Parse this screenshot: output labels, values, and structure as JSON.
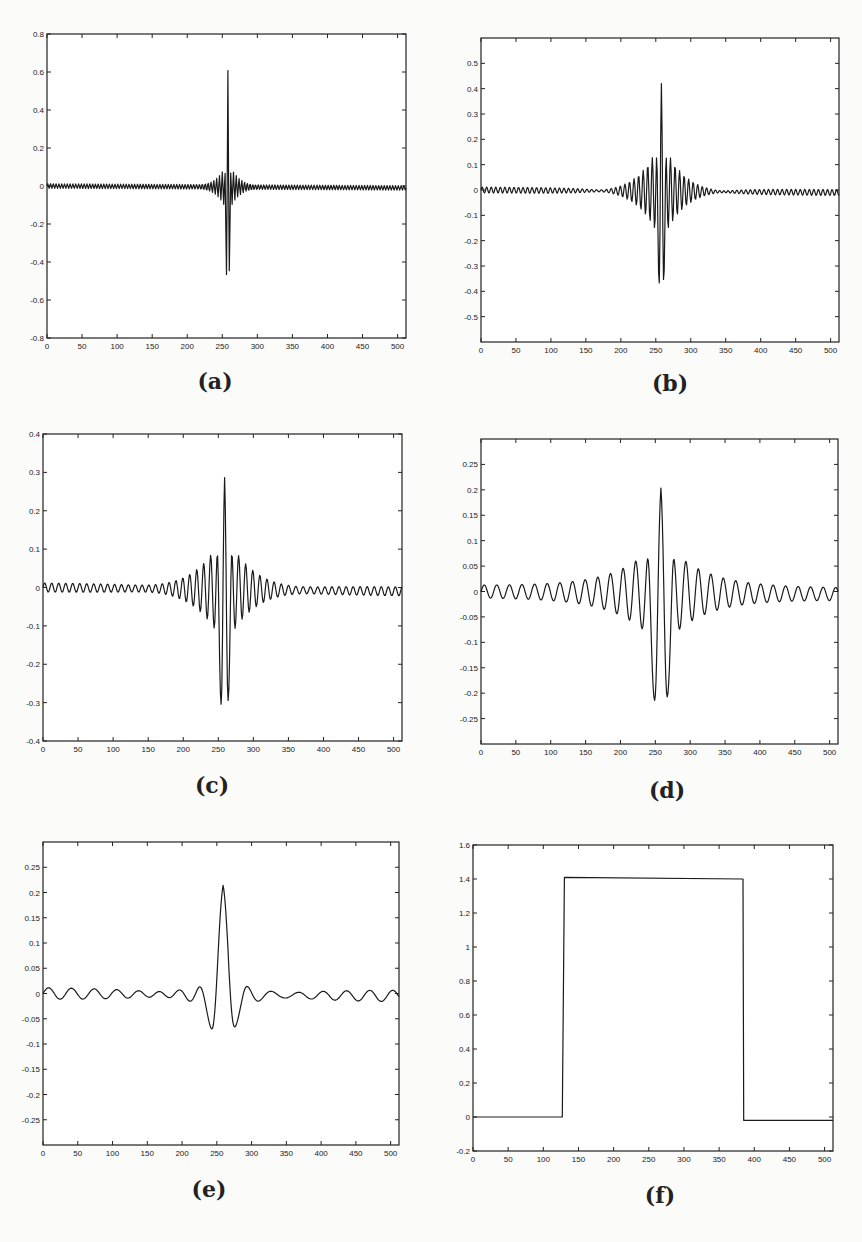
{
  "figure": {
    "panels": [
      {
        "id": "a",
        "caption": "(a)"
      },
      {
        "id": "b",
        "caption": "(b)"
      },
      {
        "id": "c",
        "caption": "(c)"
      },
      {
        "id": "d",
        "caption": "(d)"
      },
      {
        "id": "e",
        "caption": "(e)"
      },
      {
        "id": "f",
        "caption": "(f)"
      }
    ]
  },
  "chart_data": [
    {
      "panel": "(a)",
      "type": "line",
      "title": "",
      "xlabel": "",
      "ylabel": "",
      "xlim": [
        0,
        512
      ],
      "ylim": [
        -0.8,
        0.8
      ],
      "xticks": [
        0,
        50,
        100,
        150,
        200,
        250,
        300,
        350,
        400,
        450,
        500
      ],
      "yticks": [
        -0.8,
        -0.6,
        -0.4,
        -0.2,
        0,
        0.2,
        0.4,
        0.6,
        0.8
      ],
      "ytick_labels": [
        "-0.8",
        "-0.6",
        "-0.4",
        "-0.2",
        "0",
        "0.2",
        "0.4",
        "0.6",
        "0.8"
      ],
      "grid": false,
      "description": "Highly localized oscillating wavelet centered near x=258; main peak ~0.70, main trough ~-0.46, envelope decaying rapidly; nearly flat elsewhere with slight negative drift to ~-0.01 at x=512",
      "signal": {
        "center": 258,
        "peak": 0.7,
        "trough": -0.46,
        "period": 4,
        "decay": 14,
        "envelope_amp": 0.14,
        "drift_end": -0.01
      },
      "key_points": [
        {
          "x": 258,
          "y": 0.7
        },
        {
          "x": 257,
          "y": -0.46
        },
        {
          "x": 258,
          "y": 0.14
        },
        {
          "x": 0,
          "y": 0
        },
        {
          "x": 512,
          "y": -0.01
        }
      ]
    },
    {
      "panel": "(b)",
      "type": "line",
      "title": "",
      "xlabel": "",
      "ylabel": "",
      "xlim": [
        0,
        512
      ],
      "ylim": [
        -0.6,
        0.6
      ],
      "xticks": [
        0,
        50,
        100,
        150,
        200,
        250,
        300,
        350,
        400,
        450,
        500
      ],
      "yticks": [
        -0.5,
        -0.4,
        -0.3,
        -0.2,
        -0.1,
        0,
        0.1,
        0.2,
        0.3,
        0.4,
        0.5
      ],
      "ytick_labels": [
        "-0.5",
        "-0.4",
        "-0.3",
        "-0.2",
        "-0.1",
        "0",
        "0.1",
        "0.2",
        "0.3",
        "0.4",
        "0.5"
      ],
      "grid": false,
      "description": "Oscillating wavelet centered at x~258; peak ~0.49, side peaks ~0.21, troughs ~-0.37; oscillation period ~6 samples with slow decay",
      "signal": {
        "center": 258,
        "peak": 0.49,
        "trough": -0.37,
        "period": 6.5,
        "decay": 30,
        "envelope_amp": 0.21,
        "drift_end": -0.01
      },
      "key_points": [
        {
          "x": 258,
          "y": 0.49
        },
        {
          "x": 252,
          "y": 0.21
        },
        {
          "x": 264,
          "y": 0.2
        },
        {
          "x": 254,
          "y": -0.37
        },
        {
          "x": 262,
          "y": -0.36
        }
      ]
    },
    {
      "panel": "(c)",
      "type": "line",
      "title": "",
      "xlabel": "",
      "ylabel": "",
      "xlim": [
        0,
        512
      ],
      "ylim": [
        -0.4,
        0.4
      ],
      "xticks": [
        0,
        50,
        100,
        150,
        200,
        250,
        300,
        350,
        400,
        450,
        500
      ],
      "yticks": [
        -0.4,
        -0.3,
        -0.2,
        -0.1,
        0,
        0.1,
        0.2,
        0.3,
        0.4
      ],
      "ytick_labels": [
        "-0.4",
        "-0.3",
        "-0.2",
        "-0.1",
        "0",
        "0.1",
        "0.2",
        "0.3",
        "0.4"
      ],
      "grid": false,
      "description": "Wavelet centered at x~259; peak ~0.34, side peaks ~0.15/0.14, troughs ~-0.30/-0.29; small ripple ~±0.01 elsewhere",
      "signal": {
        "center": 259,
        "peak": 0.34,
        "trough": -0.3,
        "period": 10,
        "decay": 40,
        "envelope_amp": 0.15,
        "drift_end": -0.01
      },
      "key_points": [
        {
          "x": 259,
          "y": 0.34
        },
        {
          "x": 249,
          "y": 0.15
        },
        {
          "x": 269,
          "y": 0.14
        },
        {
          "x": 252,
          "y": -0.3
        },
        {
          "x": 263,
          "y": -0.29
        },
        {
          "x": 237,
          "y": -0.08
        },
        {
          "x": 278,
          "y": -0.07
        }
      ]
    },
    {
      "panel": "(d)",
      "type": "line",
      "title": "",
      "xlabel": "",
      "ylabel": "",
      "xlim": [
        0,
        512
      ],
      "ylim": [
        -0.3,
        0.3
      ],
      "xticks": [
        0,
        50,
        100,
        150,
        200,
        250,
        300,
        350,
        400,
        450,
        500
      ],
      "yticks": [
        -0.25,
        -0.2,
        -0.15,
        -0.1,
        -0.05,
        0,
        0.05,
        0.1,
        0.15,
        0.2,
        0.25
      ],
      "ytick_labels": [
        "-0.25",
        "-0.2",
        "-0.15",
        "-0.1",
        "-0.05",
        "0",
        "0.05",
        "0.1",
        "0.15",
        "0.2",
        "0.25"
      ],
      "grid": false,
      "description": "Wavelet centered at x~258; peak ~0.24, side peaks ~0.11/0.09, troughs ~-0.21/-0.20; ripple ~±0.015 elsewhere",
      "signal": {
        "center": 258,
        "peak": 0.24,
        "trough": -0.21,
        "period": 18,
        "decay": 55,
        "envelope_amp": 0.11,
        "drift_end": -0.005
      },
      "key_points": [
        {
          "x": 258,
          "y": 0.24
        },
        {
          "x": 238,
          "y": 0.11
        },
        {
          "x": 279,
          "y": 0.09
        },
        {
          "x": 248,
          "y": -0.21
        },
        {
          "x": 268,
          "y": -0.2
        },
        {
          "x": 215,
          "y": -0.065
        },
        {
          "x": 302,
          "y": -0.04
        }
      ]
    },
    {
      "panel": "(e)",
      "type": "line",
      "title": "",
      "xlabel": "",
      "ylabel": "",
      "xlim": [
        0,
        512
      ],
      "ylim": [
        -0.3,
        0.3
      ],
      "xticks": [
        0,
        50,
        100,
        150,
        200,
        250,
        300,
        350,
        400,
        450,
        500
      ],
      "yticks": [
        -0.25,
        -0.2,
        -0.15,
        -0.1,
        -0.05,
        0,
        0.05,
        0.1,
        0.15,
        0.2,
        0.25
      ],
      "ytick_labels": [
        "-0.25",
        "-0.2",
        "-0.15",
        "-0.1",
        "-0.05",
        "0",
        "0.05",
        "0.1",
        "0.15",
        "0.2",
        "0.25"
      ],
      "grid": false,
      "description": "Smooth sinc-like wavelet; main peak ~0.24 at x~259, troughs ~-0.07 at x~234 and ~-0.045 at x~282; ripple ~±0.015 with period ~33",
      "signal": {
        "center": 259,
        "peak": 0.24,
        "trough": -0.07,
        "period": 33,
        "decay": 60,
        "envelope_amp": 0.04,
        "drift_end": -0.005
      },
      "key_points": [
        {
          "x": 259,
          "y": 0.24
        },
        {
          "x": 234,
          "y": -0.07
        },
        {
          "x": 282,
          "y": -0.045
        },
        {
          "x": 218,
          "y": 0.04
        },
        {
          "x": 300,
          "y": 0.015
        }
      ]
    },
    {
      "panel": "(f)",
      "type": "line",
      "title": "",
      "xlabel": "",
      "ylabel": "",
      "xlim": [
        0,
        512
      ],
      "ylim": [
        -0.2,
        1.6
      ],
      "xticks": [
        0,
        50,
        100,
        150,
        200,
        250,
        300,
        350,
        400,
        450,
        500
      ],
      "yticks": [
        -0.2,
        0,
        0.2,
        0.4,
        0.6,
        0.8,
        1,
        1.2,
        1.4,
        1.6
      ],
      "ytick_labels": [
        "-0.2",
        "0",
        "0.2",
        "0.4",
        "0.6",
        "0.8",
        "1",
        "1.2",
        "1.4",
        "1.6"
      ],
      "grid": false,
      "description": "Rectangular pulse: ~0 for x<128, ~1.41 for 128<=x<=384, ~-0.02 for x>384",
      "x": [
        0,
        127,
        130,
        384,
        385,
        512
      ],
      "y": [
        0,
        0,
        1.41,
        1.4,
        -0.02,
        -0.02
      ]
    }
  ]
}
